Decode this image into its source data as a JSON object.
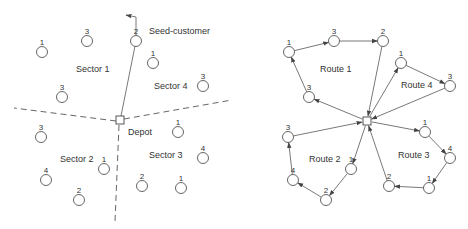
{
  "left_panel": {
    "title": "Sweep sectors",
    "labels": {
      "sector1": "Sector 1",
      "sector2": "Sector 2",
      "sector3": "Sector 3",
      "sector4": "Sector 4",
      "depot": "Depot",
      "seed": "Seed-customer"
    },
    "customers": [
      {
        "demand": "1",
        "x": 42,
        "y": 52
      },
      {
        "demand": "3",
        "x": 87,
        "y": 41
      },
      {
        "demand": "2",
        "x": 136,
        "y": 41
      },
      {
        "demand": "1",
        "x": 153,
        "y": 63
      },
      {
        "demand": "3",
        "x": 62,
        "y": 97
      },
      {
        "demand": "3",
        "x": 203,
        "y": 86
      },
      {
        "demand": "3",
        "x": 41,
        "y": 137
      },
      {
        "demand": "1",
        "x": 178,
        "y": 132
      },
      {
        "demand": "4",
        "x": 203,
        "y": 158
      },
      {
        "demand": "1",
        "x": 104,
        "y": 169
      },
      {
        "demand": "4",
        "x": 46,
        "y": 180
      },
      {
        "demand": "2",
        "x": 142,
        "y": 186
      },
      {
        "demand": "1",
        "x": 181,
        "y": 188
      },
      {
        "demand": "2",
        "x": 79,
        "y": 200
      }
    ]
  },
  "right_panel": {
    "title": "Routes",
    "labels": {
      "route1": "Route 1",
      "route2": "Route 2",
      "route3": "Route 3",
      "route4": "Route 4"
    },
    "routes": [
      {
        "name": "Route 1",
        "stops": [
          {
            "demand": "3",
            "x": 309,
            "y": 97
          },
          {
            "demand": "1",
            "x": 289,
            "y": 52
          },
          {
            "demand": "3",
            "x": 334,
            "y": 41
          },
          {
            "demand": "2",
            "x": 383,
            "y": 41
          }
        ]
      },
      {
        "name": "Route 4",
        "stops": [
          {
            "demand": "1",
            "x": 401,
            "y": 63
          },
          {
            "demand": "3",
            "x": 450,
            "y": 86
          }
        ]
      },
      {
        "name": "Route 3",
        "stops": [
          {
            "demand": "1",
            "x": 425,
            "y": 132
          },
          {
            "demand": "4",
            "x": 450,
            "y": 158
          },
          {
            "demand": "1",
            "x": 429,
            "y": 188
          },
          {
            "demand": "2",
            "x": 389,
            "y": 186
          }
        ]
      },
      {
        "name": "Route 2",
        "stops": [
          {
            "demand": "1",
            "x": 351,
            "y": 169
          },
          {
            "demand": "2",
            "x": 326,
            "y": 200
          },
          {
            "demand": "4",
            "x": 293,
            "y": 180
          },
          {
            "demand": "3",
            "x": 288,
            "y": 137
          }
        ]
      }
    ]
  },
  "colors": {
    "stroke": "#555555",
    "text": "#333333",
    "background": "#ffffff"
  }
}
